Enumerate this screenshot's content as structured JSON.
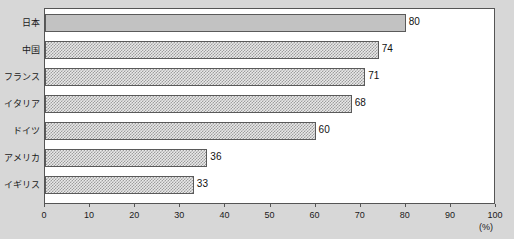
{
  "chart_data": {
    "type": "bar",
    "orientation": "horizontal",
    "title": "",
    "xlabel": "(%)",
    "ylabel": "",
    "categories": [
      "日本",
      "中国",
      "フランス",
      "イタリア",
      "ドイツ",
      "アメリカ",
      "イギリス"
    ],
    "values": [
      80,
      74,
      71,
      68,
      60,
      36,
      33
    ],
    "value_labels": [
      "80",
      "74",
      "71",
      "68",
      "60",
      "36",
      "33"
    ],
    "bar_styles": [
      "solid",
      "dither",
      "dither",
      "dither",
      "dither",
      "dither",
      "dither"
    ],
    "xlim": [
      0,
      100
    ],
    "xticks": [
      0,
      10,
      20,
      30,
      40,
      50,
      60,
      70,
      80,
      90,
      100
    ],
    "xtick_labels": [
      "0",
      "10",
      "20",
      "30",
      "40",
      "50",
      "60",
      "70",
      "80",
      "90",
      "100"
    ],
    "grid": false,
    "legend": null,
    "unit_label": "(%)",
    "colors": {
      "background": "#d7d7d7",
      "plot_background": "#ffffff",
      "frame": "#555555",
      "bar_solid": "#c2c2c2",
      "bar_pattern": "#9d9d9d",
      "text": "#1a1a1a"
    }
  }
}
